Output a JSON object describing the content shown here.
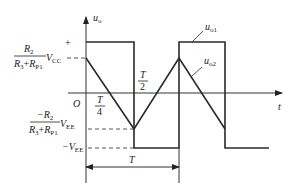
{
  "diagram": {
    "title": "",
    "axes": {
      "y_label": "u",
      "y_label_sub": "o",
      "x_label": "t",
      "origin_label": "O"
    },
    "signals": [
      {
        "name": "u_o1",
        "label": "u",
        "sub": "o1",
        "shape": "square-wave"
      },
      {
        "name": "u_o2",
        "label": "u",
        "sub": "o2",
        "shape": "triangle-wave"
      }
    ],
    "level_labels": {
      "plus": "+",
      "upper_threshold": {
        "numerator": "R",
        "numerator_sub": "2",
        "denominator_a": "R",
        "denominator_a_sub": "3",
        "denominator_plus": "+",
        "denominator_b": "R",
        "denominator_b_sub": "P1",
        "supply": "V",
        "supply_sub": "CC"
      },
      "lower_threshold": {
        "numerator": "−R",
        "numerator_sub": "2",
        "denominator_a": "R",
        "denominator_a_sub": "3",
        "denominator_plus": "+",
        "denominator_b": "R",
        "denominator_b_sub": "P1",
        "supply": "V",
        "supply_sub": "EE"
      },
      "neg_supply": {
        "prefix": "−V",
        "sub": "EE"
      }
    },
    "time_labels": {
      "quarter": {
        "num": "T",
        "den": "4"
      },
      "half": {
        "num": "T",
        "den": "2"
      },
      "period": "T"
    }
  }
}
